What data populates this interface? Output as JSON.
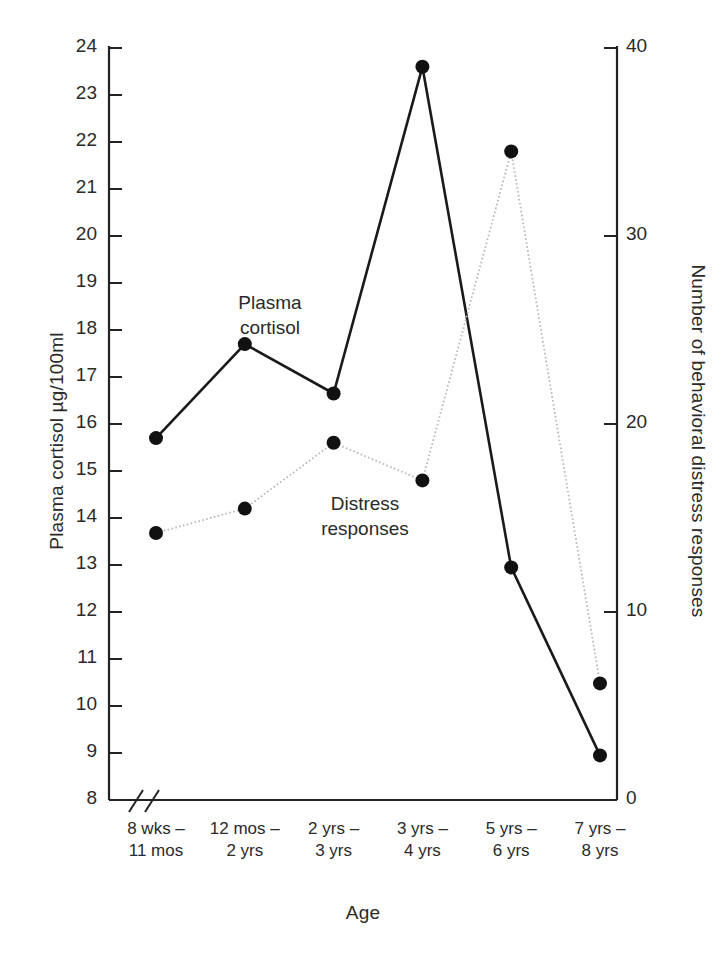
{
  "chart_data": {
    "type": "line",
    "title": "",
    "xlabel": "Age",
    "categories": [
      "8 wks –\n11 mos",
      "12 mos –\n2 yrs",
      "2 yrs –\n3 yrs",
      "3 yrs –\n4 yrs",
      "5 yrs –\n6 yrs",
      "7 yrs –\n8 yrs"
    ],
    "categories_lines": [
      [
        "8 wks –",
        "11 mos"
      ],
      [
        "12 mos –",
        "2 yrs"
      ],
      [
        "2 yrs –",
        "3 yrs"
      ],
      [
        "3 yrs –",
        "4 yrs"
      ],
      [
        "5 yrs –",
        "6 yrs"
      ],
      [
        "7 yrs –",
        "8 yrs"
      ]
    ],
    "grid": false,
    "legend_position": "inline-annotation",
    "axes": {
      "left": {
        "label": "Plasma cortisol µg/100ml",
        "ylim": [
          8,
          24
        ],
        "ticks": [
          8,
          9,
          10,
          11,
          12,
          13,
          14,
          15,
          16,
          17,
          18,
          19,
          20,
          21,
          22,
          23,
          24
        ],
        "tick_labels": [
          "8",
          "9",
          "10",
          "11",
          "12",
          "13",
          "14",
          "15",
          "16",
          "17",
          "18",
          "19",
          "20",
          "21",
          "22",
          "23",
          "24"
        ],
        "axis_break": true
      },
      "right": {
        "label": "Number of behavioral distress responses",
        "ylim": [
          0,
          40
        ],
        "ticks": [
          0,
          10,
          20,
          30,
          40
        ],
        "tick_labels": [
          "0",
          "10",
          "20",
          "30",
          "40"
        ]
      }
    },
    "series": [
      {
        "name": "Plasma cortisol",
        "axis": "left",
        "style": "solid",
        "color": "#1a1a1a",
        "marker": "filled-circle",
        "values": [
          15.7,
          17.7,
          16.65,
          23.6,
          12.95,
          8.95
        ]
      },
      {
        "name": "Distress responses",
        "axis": "right",
        "style": "dotted",
        "color": "#b8b8b8",
        "marker": "filled-circle",
        "values": [
          14.2,
          15.5,
          19.0,
          17.0,
          34.5,
          6.2
        ]
      }
    ],
    "annotations": [
      {
        "text": "Plasma\ncortisol",
        "lines": [
          "Plasma",
          "cortisol"
        ],
        "x_px": 270,
        "y_px": 291
      },
      {
        "text": "Distress\nresponses",
        "lines": [
          "Distress",
          "responses"
        ],
        "x_px": 365,
        "y_px": 492
      }
    ]
  }
}
